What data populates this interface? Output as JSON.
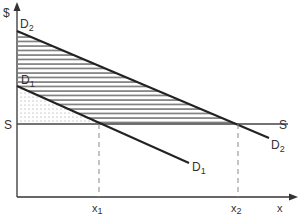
{
  "diagram": {
    "type": "supply-demand",
    "axes": {
      "y_label": "$",
      "x_label": "x"
    },
    "curves": {
      "demand_1": {
        "label": "D",
        "subscript": "1"
      },
      "demand_2": {
        "label": "D",
        "subscript": "2"
      },
      "supply": {
        "label": "S",
        "label_right": "S"
      }
    },
    "quantities": {
      "x1": {
        "label": "x",
        "subscript": "1"
      },
      "x2": {
        "label": "x",
        "subscript": "2"
      }
    },
    "regions": {
      "hatched": "area between D2 and S (above S) minus dotted region",
      "dotted": "area between D1 and S, left of x1"
    },
    "colors": {
      "line": "#222222",
      "hatch": "#444444",
      "dashed": "#888888"
    }
  }
}
